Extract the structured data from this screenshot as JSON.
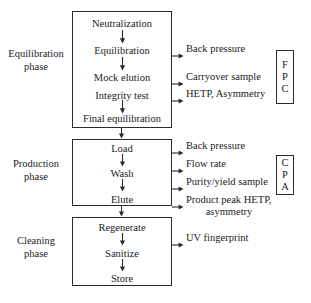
{
  "diagram": {
    "line_color": "#2b2b2b",
    "background": "#ffffff"
  },
  "phases": [
    {
      "id": "equilibration",
      "label_line1": "Equilibration",
      "label_line2": "phase",
      "steps": [
        {
          "label": "Neutralization"
        },
        {
          "label": "Equilibration"
        },
        {
          "label": "Mock elution"
        },
        {
          "label": "Integrity test"
        },
        {
          "label": "Final equilibration"
        }
      ],
      "measurements": [
        {
          "label": "Back pressure"
        },
        {
          "label": "Carryover sample"
        },
        {
          "label": "HETP, Asymmetry"
        }
      ],
      "badge": {
        "letters": [
          "F",
          "P",
          "C"
        ]
      }
    },
    {
      "id": "production",
      "label_line1": "Production",
      "label_line2": "phase",
      "steps": [
        {
          "label": "Load"
        },
        {
          "label": "Wash"
        },
        {
          "label": "Elute"
        }
      ],
      "measurements": [
        {
          "label": "Back pressure"
        },
        {
          "label": "Flow rate"
        },
        {
          "label": "Purity/yield sample"
        },
        {
          "label": "Product peak HETP,",
          "label_second_line": "asymmetry"
        }
      ],
      "badge": {
        "letters": [
          "C",
          "P",
          "A"
        ]
      }
    },
    {
      "id": "cleaning",
      "label_line1": "Cleaning",
      "label_line2": "phase",
      "steps": [
        {
          "label": "Regenerate"
        },
        {
          "label": "Sanitize"
        },
        {
          "label": "Store"
        }
      ],
      "measurements": [
        {
          "label": "UV fingerprint"
        }
      ],
      "badge": null
    }
  ]
}
